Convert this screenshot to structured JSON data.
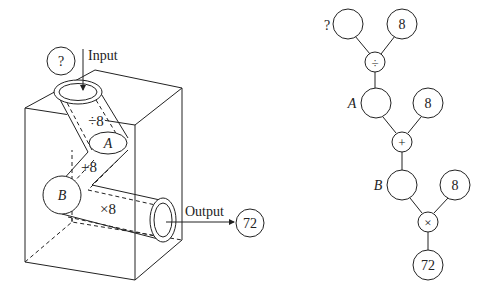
{
  "left_diagram": {
    "input_label": "Input",
    "output_label": "Output",
    "input_value": "?",
    "output_value": "72",
    "steps": [
      {
        "label": "÷8",
        "op": "÷",
        "operand": "8"
      },
      {
        "label": "+8",
        "op": "+",
        "operand": "8"
      },
      {
        "label": "×8",
        "op": "×",
        "operand": "8"
      }
    ],
    "intermediate_labels": {
      "a": "A",
      "b": "B"
    }
  },
  "right_tree": {
    "input_value": "?",
    "operands": [
      "8",
      "8",
      "8"
    ],
    "operators": [
      "÷",
      "+",
      "×"
    ],
    "node_labels": {
      "a": "A",
      "b": "B"
    },
    "output_value": "72"
  }
}
